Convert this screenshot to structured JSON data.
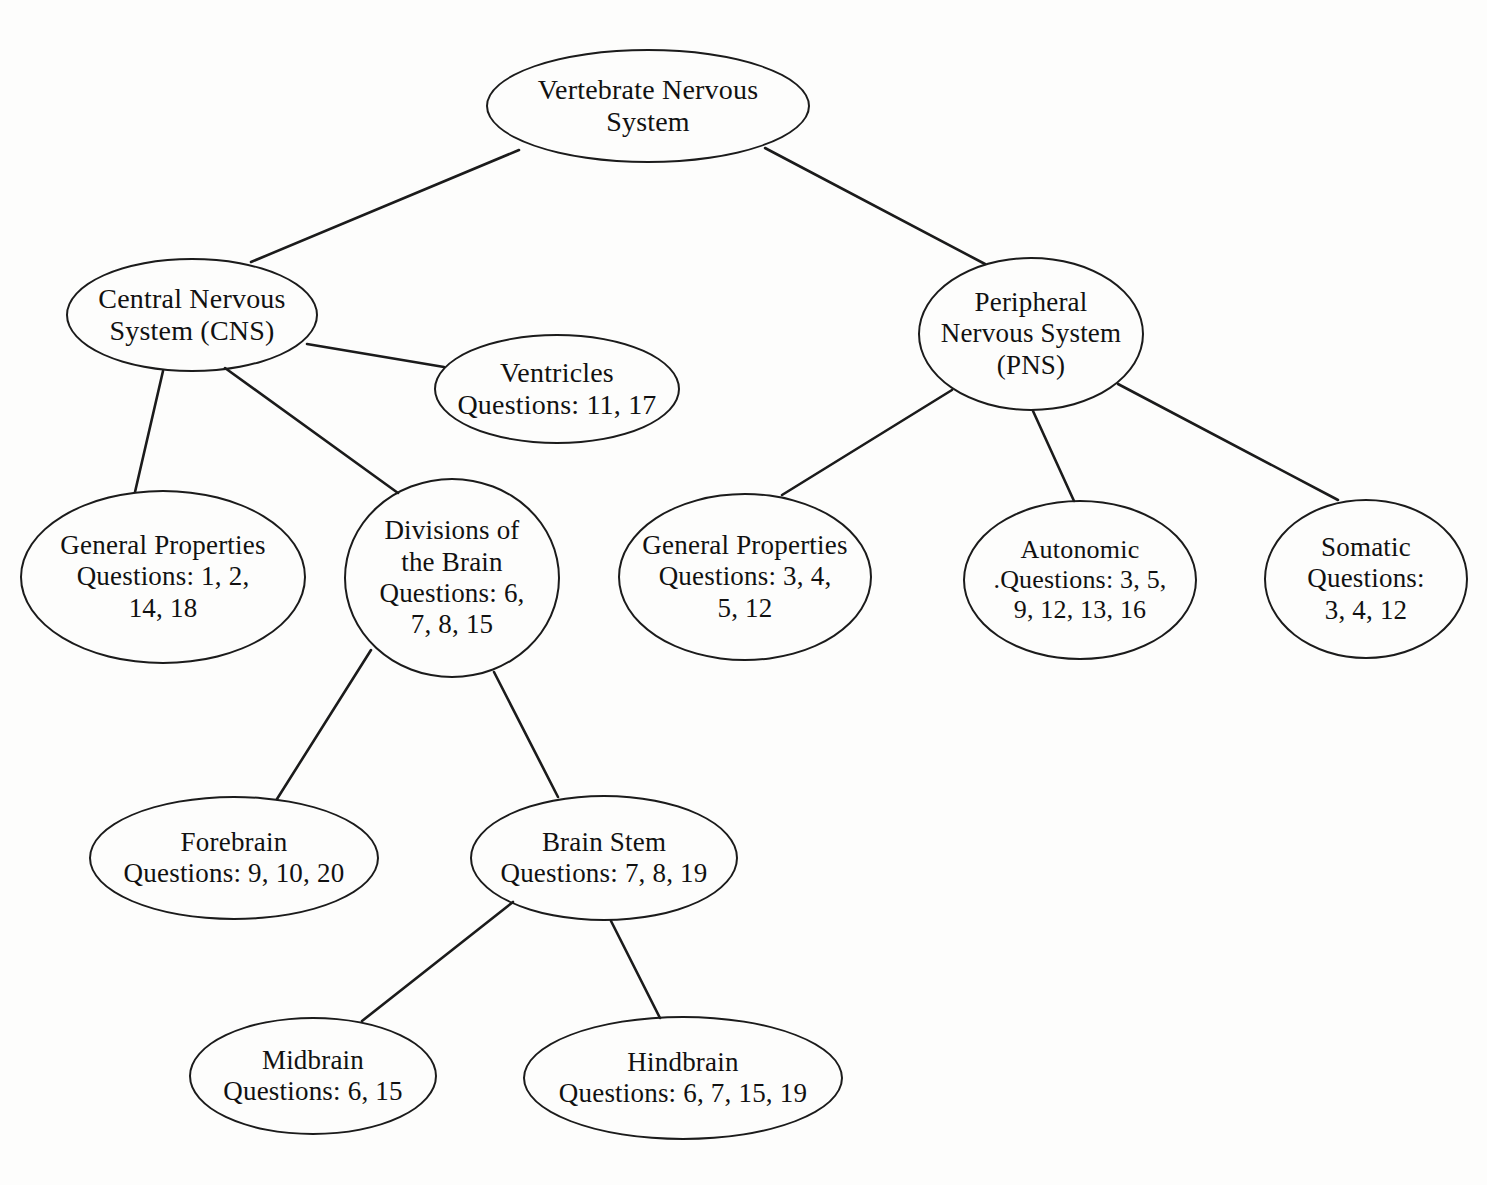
{
  "diagram": {
    "type": "concept-map",
    "title": "Vertebrate Nervous System",
    "background_color": "#fdfdfc",
    "stroke_color": "#1b1b1b",
    "text_color": "#111111"
  },
  "nodes": [
    {
      "id": "vertebrate-nervous-system",
      "label": "Vertebrate Nervous\nSystem",
      "cx": 648,
      "cy": 106,
      "rx": 162,
      "ry": 57,
      "font": "fs-28"
    },
    {
      "id": "central-nervous-system",
      "label": "Central Nervous\nSystem (CNS)",
      "cx": 192,
      "cy": 315,
      "rx": 126,
      "ry": 57,
      "font": "fs-28"
    },
    {
      "id": "peripheral-nervous-system",
      "label": "Peripheral\nNervous System\n(PNS)",
      "cx": 1031,
      "cy": 334,
      "rx": 113,
      "ry": 77,
      "font": "fs-27"
    },
    {
      "id": "ventricles",
      "label": "Ventricles\nQuestions: 11, 17",
      "cx": 557,
      "cy": 389,
      "rx": 123,
      "ry": 55,
      "font": "fs-28"
    },
    {
      "id": "cns-general-properties",
      "label": "General Properties\nQuestions: 1, 2,\n14, 18",
      "cx": 163,
      "cy": 577,
      "rx": 143,
      "ry": 87,
      "font": "fs-27"
    },
    {
      "id": "divisions-of-the-brain",
      "label": "Divisions of\nthe Brain\nQuestions: 6,\n7, 8, 15",
      "cx": 452,
      "cy": 578,
      "rx": 108,
      "ry": 100,
      "font": "fs-27"
    },
    {
      "id": "pns-general-properties",
      "label": "General Properties\nQuestions: 3, 4,\n5, 12",
      "cx": 745,
      "cy": 577,
      "rx": 127,
      "ry": 84,
      "font": "fs-27"
    },
    {
      "id": "autonomic",
      "label": "Autonomic\n.Questions: 3, 5,\n9, 12, 13, 16",
      "cx": 1080,
      "cy": 580,
      "rx": 117,
      "ry": 80,
      "font": "fs-26"
    },
    {
      "id": "somatic",
      "label": "Somatic\nQuestions:\n3, 4, 12",
      "cx": 1366,
      "cy": 579,
      "rx": 102,
      "ry": 80,
      "font": "fs-27"
    },
    {
      "id": "forebrain",
      "label": "Forebrain\nQuestions: 9, 10, 20",
      "cx": 234,
      "cy": 858,
      "rx": 145,
      "ry": 62,
      "font": "fs-27"
    },
    {
      "id": "brain-stem",
      "label": "Brain Stem\nQuestions: 7, 8, 19",
      "cx": 604,
      "cy": 858,
      "rx": 134,
      "ry": 63,
      "font": "fs-27"
    },
    {
      "id": "midbrain",
      "label": "Midbrain\nQuestions: 6, 15",
      "cx": 313,
      "cy": 1076,
      "rx": 124,
      "ry": 59,
      "font": "fs-27"
    },
    {
      "id": "hindbrain",
      "label": "Hindbrain\nQuestions: 6, 7, 15, 19",
      "cx": 683,
      "cy": 1078,
      "rx": 160,
      "ry": 62,
      "font": "fs-27"
    }
  ],
  "edges": [
    {
      "id": "edge-vns-cns",
      "from": "vertebrate-nervous-system",
      "to": "central-nervous-system",
      "x1": 519,
      "y1": 150,
      "x2": 251,
      "y2": 262
    },
    {
      "id": "edge-vns-pns",
      "from": "vertebrate-nervous-system",
      "to": "peripheral-nervous-system",
      "x1": 765,
      "y1": 148,
      "x2": 985,
      "y2": 264
    },
    {
      "id": "edge-cns-ventricles",
      "from": "central-nervous-system",
      "to": "ventricles",
      "x1": 307,
      "y1": 344,
      "x2": 444,
      "y2": 367
    },
    {
      "id": "edge-cns-general",
      "from": "central-nervous-system",
      "to": "cns-general-properties",
      "x1": 163,
      "y1": 371,
      "x2": 135,
      "y2": 492
    },
    {
      "id": "edge-cns-divisions",
      "from": "central-nervous-system",
      "to": "divisions-of-the-brain",
      "x1": 225,
      "y1": 368,
      "x2": 398,
      "y2": 493
    },
    {
      "id": "edge-pns-general",
      "from": "peripheral-nervous-system",
      "to": "pns-general-properties",
      "x1": 952,
      "y1": 390,
      "x2": 782,
      "y2": 495
    },
    {
      "id": "edge-pns-autonomic",
      "from": "peripheral-nervous-system",
      "to": "autonomic",
      "x1": 1033,
      "y1": 411,
      "x2": 1074,
      "y2": 501
    },
    {
      "id": "edge-pns-somatic",
      "from": "peripheral-nervous-system",
      "to": "somatic",
      "x1": 1118,
      "y1": 384,
      "x2": 1338,
      "y2": 500
    },
    {
      "id": "edge-divisions-fore",
      "from": "divisions-of-the-brain",
      "to": "forebrain",
      "x1": 371,
      "y1": 650,
      "x2": 277,
      "y2": 799
    },
    {
      "id": "edge-divisions-stem",
      "from": "divisions-of-the-brain",
      "to": "brain-stem",
      "x1": 494,
      "y1": 672,
      "x2": 558,
      "y2": 797
    },
    {
      "id": "edge-stem-midbrain",
      "from": "brain-stem",
      "to": "midbrain",
      "x1": 513,
      "y1": 902,
      "x2": 362,
      "y2": 1021
    },
    {
      "id": "edge-stem-hindbrain",
      "from": "brain-stem",
      "to": "hindbrain",
      "x1": 611,
      "y1": 921,
      "x2": 660,
      "y2": 1018
    }
  ]
}
